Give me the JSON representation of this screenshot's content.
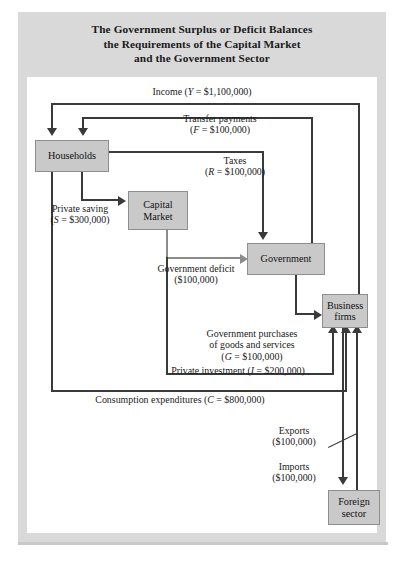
{
  "title": {
    "line1": "The Government Surplus or Deficit Balances",
    "line2": "the Requirements of the Capital Market",
    "line3": "and the Government Sector"
  },
  "sectors": {
    "households": "Households",
    "capital_market_line1": "Capital",
    "capital_market_line2": "Market",
    "government": "Government",
    "business_line1": "Business",
    "business_line2": "firms",
    "foreign_line1": "Foreign",
    "foreign_line2": "sector"
  },
  "flows": {
    "income": {
      "label": "Income (Y = $1,100,000)",
      "symbol": "Y",
      "value": "$1,100,000"
    },
    "transfer": {
      "line1": "Transfer payments",
      "line2": "(F = $100,000)",
      "symbol": "F",
      "value": "$100,000"
    },
    "taxes": {
      "line1": "Taxes",
      "line2": "(R = $100,000)",
      "symbol": "R",
      "value": "$100,000"
    },
    "private_saving": {
      "line1": "Private saving",
      "line2": "(S = $300,000)",
      "symbol": "S",
      "value": "$300,000"
    },
    "government_deficit": {
      "line1": "Government deficit",
      "line2": "($100,000)",
      "value": "$100,000"
    },
    "government_purchases": {
      "line1": "Government purchases",
      "line2": "of goods and services",
      "line3": "(G = $100,000)",
      "symbol": "G",
      "value": "$100,000"
    },
    "private_investment": {
      "label": "Private investment (I = $200,000)",
      "symbol": "I",
      "value": "$200,000"
    },
    "consumption": {
      "label": "Consumption expenditures (C = $800,000)",
      "symbol": "C",
      "value": "$800,000"
    },
    "exports": {
      "line1": "Exports",
      "line2": "($100,000)",
      "value": "$100,000"
    },
    "imports": {
      "line1": "Imports",
      "line2": "($100,000)",
      "value": "$100,000"
    }
  },
  "colors": {
    "box_fill": "#c9c9c9",
    "mat": "#d9d9d9",
    "line": "#3a3a3a",
    "line_light": "#8b8b8b",
    "panel": "#ffffff"
  }
}
